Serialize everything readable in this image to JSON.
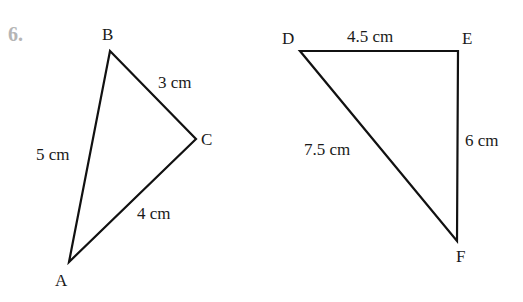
{
  "question_number": "6.",
  "triangles": [
    {
      "name": "ABC",
      "vertices": {
        "A": {
          "label": "A",
          "x": 69,
          "y": 262
        },
        "B": {
          "label": "B",
          "x": 110,
          "y": 51
        },
        "C": {
          "label": "C",
          "x": 196,
          "y": 139
        }
      },
      "sides": {
        "AB": "5 cm",
        "BC": "3 cm",
        "CA": "4 cm"
      }
    },
    {
      "name": "DEF",
      "vertices": {
        "D": {
          "label": "D",
          "x": 300,
          "y": 51
        },
        "E": {
          "label": "E",
          "x": 458,
          "y": 51
        },
        "F": {
          "label": "F",
          "x": 457,
          "y": 241
        }
      },
      "sides": {
        "DE": "4.5 cm",
        "EF": "6 cm",
        "DF": "7.5 cm"
      }
    }
  ]
}
